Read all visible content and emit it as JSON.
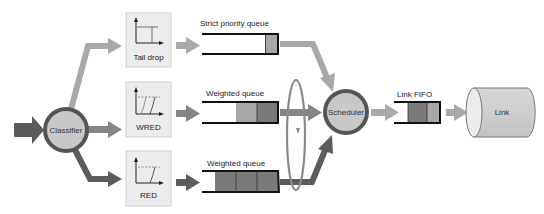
{
  "diagram": {
    "title": "",
    "nodes": {
      "classifier": {
        "label": "Classifier"
      },
      "scheduler": {
        "label": "Scheduler"
      },
      "link": {
        "label": "Link"
      }
    },
    "droppers": [
      {
        "id": "tail-drop",
        "label": "Tail drop"
      },
      {
        "id": "wred",
        "label": "WRED"
      },
      {
        "id": "red",
        "label": "RED"
      }
    ],
    "queues": [
      {
        "id": "strict-priority",
        "label": "Strict priority queue",
        "packets": 1
      },
      {
        "id": "weighted-1",
        "label": "Weighted queue",
        "packets": 2
      },
      {
        "id": "weighted-2",
        "label": "Weighted queue",
        "packets": 3
      }
    ],
    "link_fifo": {
      "label": "Link  FIFO",
      "packets": 2
    },
    "colors": {
      "light_arrow": "#a9a9a9",
      "mid_arrow": "#858585",
      "dark_arrow": "#5c5c5c",
      "node_fill": "#c8c8c8",
      "node_border": "#555555",
      "box_fill": "#ececec",
      "packet_light": "#a8a8a8",
      "packet_dark": "#7a7a7a"
    }
  }
}
